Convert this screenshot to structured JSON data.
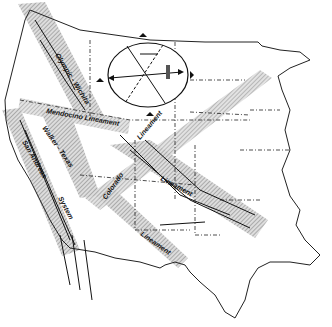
{
  "map": {
    "title": "",
    "background": "#ffffff",
    "ink_color": "#111111",
    "hatch_color": "#9a9a9a",
    "labels": {
      "olympic_wichita": "Olympic - Wichita",
      "mendocino": "Mendocino Lineament",
      "walker_texas": "Walker - Texas",
      "san_andreas": "San Andreas",
      "system": "System",
      "colorado": "Colorado",
      "lineament_ne": "Lineament",
      "lineament_central": "Lineament",
      "lineament_south": "Lineament"
    },
    "icons": {
      "stress_ellipse": "stress-ellipse-icon",
      "marker": "black-triangle-marker"
    }
  }
}
